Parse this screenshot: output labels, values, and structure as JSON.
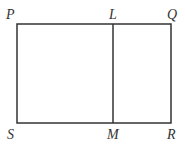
{
  "diagram": {
    "type": "geometry",
    "stroke_color": "#333333",
    "vertices": {
      "P": {
        "label": "P",
        "x": 17,
        "y": 24
      },
      "Q": {
        "label": "Q",
        "x": 171,
        "y": 24
      },
      "R": {
        "label": "R",
        "x": 171,
        "y": 123
      },
      "S": {
        "label": "S",
        "x": 17,
        "y": 123
      },
      "L": {
        "label": "L",
        "x": 113,
        "y": 24
      },
      "M": {
        "label": "M",
        "x": 113,
        "y": 123
      }
    },
    "segments": [
      [
        "P",
        "Q"
      ],
      [
        "Q",
        "R"
      ],
      [
        "R",
        "S"
      ],
      [
        "S",
        "P"
      ],
      [
        "L",
        "M"
      ]
    ]
  }
}
